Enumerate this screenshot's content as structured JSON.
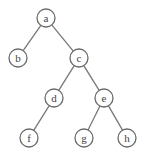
{
  "diagram": {
    "type": "binary-tree",
    "colors": {
      "edge": "#777777",
      "node_stroke": "#6a6a6a",
      "label": "#444444",
      "background": "#ffffff"
    },
    "node_radius": 9,
    "nodes": [
      {
        "id": "a",
        "label": "a",
        "x": 46,
        "y": 18
      },
      {
        "id": "b",
        "label": "b",
        "x": 18,
        "y": 58
      },
      {
        "id": "c",
        "label": "c",
        "x": 79,
        "y": 58
      },
      {
        "id": "d",
        "label": "d",
        "x": 54,
        "y": 98
      },
      {
        "id": "e",
        "label": "e",
        "x": 104,
        "y": 98
      },
      {
        "id": "f",
        "label": "f",
        "x": 29,
        "y": 138
      },
      {
        "id": "g",
        "label": "g",
        "x": 84,
        "y": 138
      },
      {
        "id": "h",
        "label": "h",
        "x": 127,
        "y": 138
      }
    ],
    "edges": [
      {
        "from": "a",
        "to": "b"
      },
      {
        "from": "a",
        "to": "c"
      },
      {
        "from": "c",
        "to": "d"
      },
      {
        "from": "c",
        "to": "e"
      },
      {
        "from": "d",
        "to": "f"
      },
      {
        "from": "e",
        "to": "g"
      },
      {
        "from": "e",
        "to": "h"
      }
    ]
  }
}
